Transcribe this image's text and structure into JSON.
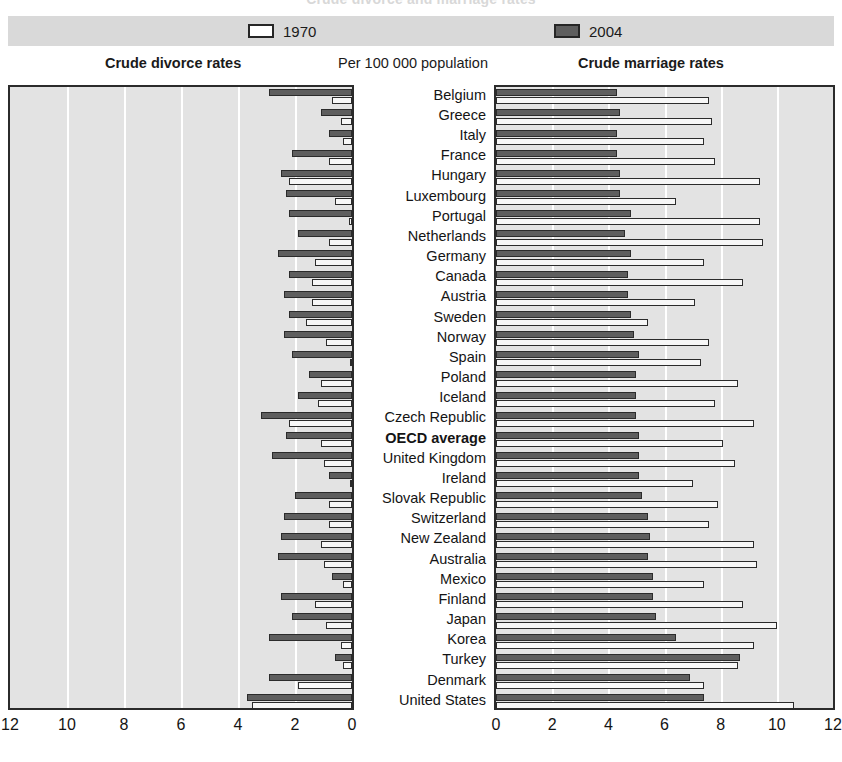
{
  "title": "Crude divorce and marriage rates",
  "legend": {
    "items": [
      {
        "label": "1970",
        "swatch": "light",
        "color": "#ffffff"
      },
      {
        "label": "2004",
        "swatch": "dark",
        "color": "#5e5e5e"
      }
    ]
  },
  "subtitles": {
    "left": "Crude divorce rates",
    "middle": "Per 100 000 population",
    "right": "Crude marriage rates"
  },
  "colors": {
    "panel_background": "#e3e3e3",
    "legend_background": "#d9d9d9",
    "gridline": "#ffffff",
    "series_1970": "#f7f7f7",
    "series_2004": "#5e5e5e",
    "outline": "#2b2b2b"
  },
  "chart_data": {
    "type": "bar",
    "title": "Crude divorce and marriage rates",
    "subtitle": "Per 100 000 population",
    "orientation": "horizontal",
    "layout": "back-to-back paired panels",
    "grid": true,
    "legend_position": "top",
    "panels": [
      {
        "name": "divorce",
        "title": "Crude divorce rates",
        "side": "left",
        "direction": "right-to-left",
        "xlabel": "",
        "xlim": [
          0,
          12
        ],
        "ticks": [
          12,
          10,
          8,
          6,
          4,
          2,
          0
        ]
      },
      {
        "name": "marriage",
        "title": "Crude marriage rates",
        "side": "right",
        "direction": "left-to-right",
        "xlabel": "",
        "xlim": [
          0,
          12
        ],
        "ticks": [
          0,
          2,
          4,
          6,
          8,
          10,
          12
        ]
      }
    ],
    "categories": [
      "Belgium",
      "Greece",
      "Italy",
      "France",
      "Hungary",
      "Luxembourg",
      "Portugal",
      "Netherlands",
      "Germany",
      "Canada",
      "Austria",
      "Sweden",
      "Norway",
      "Spain",
      "Poland",
      "Iceland",
      "Czech Republic",
      "OECD average",
      "United Kingdom",
      "Ireland",
      "Slovak Republic",
      "Switzerland",
      "New Zealand",
      "Australia",
      "Mexico",
      "Finland",
      "Japan",
      "Korea",
      "Turkey",
      "Denmark",
      "United States"
    ],
    "highlight_category": "OECD average",
    "series": [
      {
        "name": "divorce 1970",
        "panel": "divorce",
        "year": "1970",
        "style": "light",
        "values": [
          0.7,
          0.4,
          0.3,
          0.8,
          2.2,
          0.6,
          0.1,
          0.8,
          1.3,
          1.4,
          1.4,
          1.6,
          0.9,
          0.0,
          1.1,
          1.2,
          2.2,
          1.1,
          1.0,
          0.0,
          0.8,
          0.8,
          1.1,
          1.0,
          0.3,
          1.3,
          0.9,
          0.4,
          0.3,
          1.9,
          3.5
        ],
        "units": "per 1000 population"
      },
      {
        "name": "divorce 2004",
        "panel": "divorce",
        "year": "2004",
        "style": "dark",
        "values": [
          2.9,
          1.1,
          0.8,
          2.1,
          2.5,
          2.3,
          2.2,
          1.9,
          2.6,
          2.2,
          2.4,
          2.2,
          2.4,
          2.1,
          1.5,
          1.9,
          3.2,
          2.3,
          2.8,
          0.8,
          2.0,
          2.4,
          2.5,
          2.6,
          0.7,
          2.5,
          2.1,
          2.9,
          0.6,
          2.9,
          3.7
        ],
        "units": "per 1000 population"
      },
      {
        "name": "marriage 1970",
        "panel": "marriage",
        "year": "1970",
        "style": "light",
        "values": [
          7.6,
          7.7,
          7.4,
          7.8,
          9.4,
          6.4,
          9.4,
          9.5,
          7.4,
          8.8,
          7.1,
          5.4,
          7.6,
          7.3,
          8.6,
          7.8,
          9.2,
          8.1,
          8.5,
          7.0,
          7.9,
          7.6,
          9.2,
          9.3,
          7.4,
          8.8,
          10.0,
          9.2,
          8.6,
          7.4,
          10.6
        ],
        "units": "per 1000 population"
      },
      {
        "name": "marriage 2004",
        "panel": "marriage",
        "year": "2004",
        "style": "dark",
        "values": [
          4.3,
          4.4,
          4.3,
          4.3,
          4.4,
          4.4,
          4.8,
          4.6,
          4.8,
          4.7,
          4.7,
          4.8,
          4.9,
          5.1,
          5.0,
          5.0,
          5.0,
          5.1,
          5.1,
          5.1,
          5.2,
          5.4,
          5.5,
          5.4,
          5.6,
          5.6,
          5.7,
          6.4,
          8.7,
          6.9,
          7.4
        ],
        "units": "per 1000 population"
      }
    ]
  }
}
